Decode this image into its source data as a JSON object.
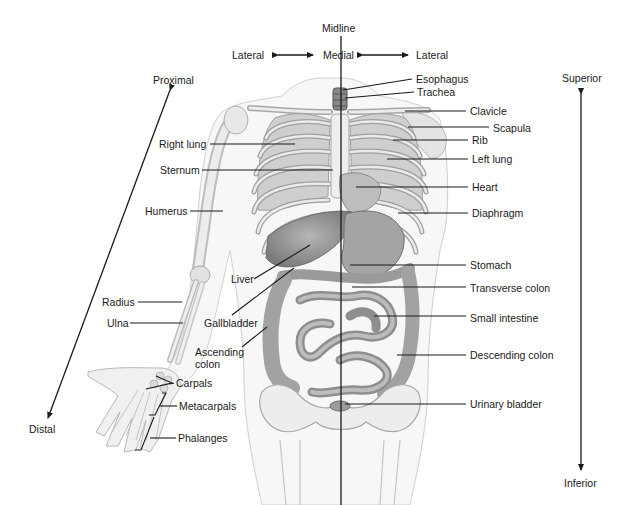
{
  "diagram": {
    "orientation": {
      "midline": "Midline",
      "medial": "Medial",
      "lateral_left": "Lateral",
      "lateral_right": "Lateral",
      "proximal": "Proximal",
      "distal": "Distal",
      "superior": "Superior",
      "inferior": "Inferior"
    },
    "left_labels": {
      "right_lung": "Right lung",
      "sternum": "Sternum",
      "humerus": "Humerus",
      "liver": "Liver",
      "radius": "Radius",
      "ulna": "Ulna",
      "gallbladder": "Gallbladder",
      "ascending_colon_1": "Ascending",
      "ascending_colon_2": "colon",
      "carpals": "Carpals",
      "metacarpals": "Metacarpals",
      "phalanges": "Phalanges"
    },
    "right_labels": {
      "esophagus": "Esophagus",
      "trachea": "Trachea",
      "clavicle": "Clavicle",
      "scapula": "Scapula",
      "rib": "Rib",
      "left_lung": "Left lung",
      "heart": "Heart",
      "diaphragm": "Diaphragm",
      "stomach": "Stomach",
      "transverse_colon": "Transverse colon",
      "small_intestine": "Small intestine",
      "descending_colon": "Descending colon",
      "urinary_bladder": "Urinary bladder"
    },
    "colors": {
      "line": "#1a1a1a",
      "bone": "#e4e4e4",
      "skin_outline": "#c8c8c8",
      "organ_dark": "#8c8c8c",
      "organ_mid": "#a8a8a8"
    }
  }
}
